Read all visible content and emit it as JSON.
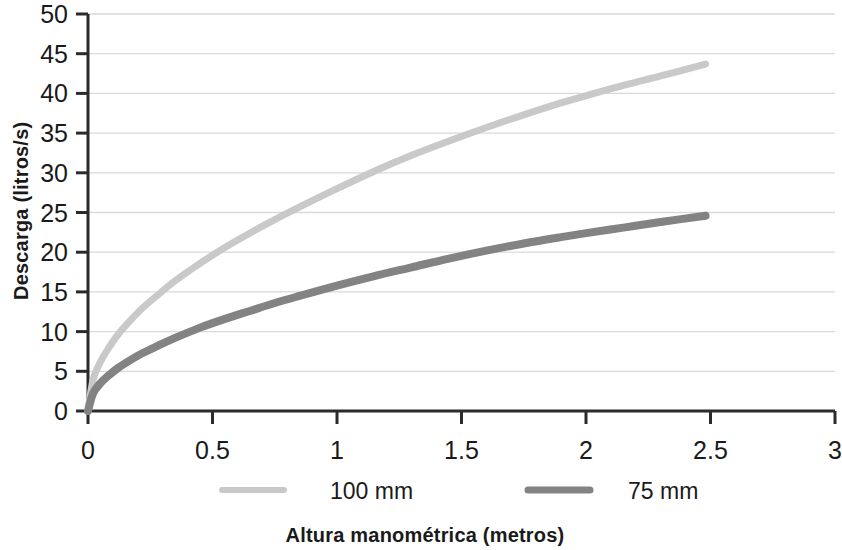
{
  "chart_data": {
    "type": "line",
    "title": "",
    "xlabel": "Altura manométrica (metros)",
    "ylabel": "Descarga (litros/s)",
    "xlim": [
      0,
      3
    ],
    "ylim": [
      0,
      50
    ],
    "xticks": [
      "0",
      "0.5",
      "1",
      "1.5",
      "2",
      "2.5",
      "3"
    ],
    "xtick_values": [
      0,
      0.5,
      1,
      1.5,
      2,
      2.5,
      3
    ],
    "yticks": [
      "0",
      "5",
      "10",
      "15",
      "20",
      "25",
      "30",
      "35",
      "40",
      "45",
      "50"
    ],
    "ytick_values": [
      0,
      5,
      10,
      15,
      20,
      25,
      30,
      35,
      40,
      45,
      50
    ],
    "grid": true,
    "grid_axis": "y",
    "grid_color": "#d9d9d9",
    "legend_position": "bottom",
    "series": [
      {
        "name": "100 mm",
        "color": "#c9c9c9",
        "line_width": 7,
        "x": [
          0,
          0.02,
          0.05,
          0.08,
          0.12,
          0.17,
          0.22,
          0.28,
          0.35,
          0.45,
          0.55,
          0.65,
          0.75,
          0.85,
          1.0,
          1.15,
          1.3,
          1.45,
          1.6,
          1.75,
          1.9,
          2.0,
          2.15,
          2.3,
          2.48
        ],
        "y": [
          0,
          3.9,
          6.2,
          7.8,
          9.6,
          11.4,
          13.0,
          14.6,
          16.4,
          18.6,
          20.6,
          22.4,
          24.1,
          25.7,
          28.0,
          30.2,
          32.2,
          34.0,
          35.7,
          37.3,
          38.8,
          39.7,
          41.0,
          42.2,
          43.7
        ]
      },
      {
        "name": "75 mm",
        "color": "#838383",
        "line_width": 8,
        "x": [
          0,
          0.02,
          0.05,
          0.08,
          0.12,
          0.17,
          0.22,
          0.28,
          0.35,
          0.45,
          0.55,
          0.65,
          0.75,
          0.85,
          1.0,
          1.15,
          1.3,
          1.45,
          1.6,
          1.75,
          1.9,
          2.0,
          2.15,
          2.3,
          2.48
        ],
        "y": [
          0,
          2.2,
          3.5,
          4.4,
          5.4,
          6.4,
          7.3,
          8.2,
          9.2,
          10.5,
          11.6,
          12.6,
          13.6,
          14.5,
          15.8,
          17.0,
          18.1,
          19.2,
          20.2,
          21.1,
          21.9,
          22.4,
          23.1,
          23.8,
          24.6
        ]
      }
    ],
    "legend": [
      {
        "label": "100 mm",
        "color": "#c9c9c9"
      },
      {
        "label": "75 mm",
        "color": "#838383"
      }
    ]
  },
  "axis": {
    "line_color": "#2b2b2b",
    "x_title": "Altura manométrica (metros)",
    "y_title": "Descarga (litros/s)"
  }
}
